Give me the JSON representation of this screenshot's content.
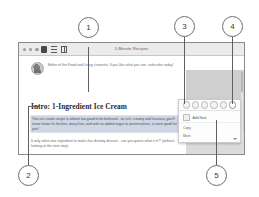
{
  "window": {
    "title": "5-Minute Recipes",
    "traffic_lights": [
      "close",
      "minimize",
      "zoom"
    ],
    "toolbar_icons": [
      "sidebar-icon",
      "list-view-icon",
      "grid-view-icon"
    ]
  },
  "article": {
    "byline": "Editor of the Food and Living channels. If you like what you see, subscribe today!",
    "heading": "Intro: 1-Ingredient Ice Cream",
    "paragraphs": [
      "This ice cream recipe is almost too good to be believed - so rich, creamy and luscious, you'll never know it's fat-free, dairy-free, and with no added sugar or preservatives, is even good for you!",
      "It only takes one ingredient to make this dreamy dessert - can you guess what it is?! (without looking at the next step)",
      "You may argue that without dairy, this has no place being called 'ice"
    ]
  },
  "context_menu": {
    "icons": [
      "highlight-yellow-icon",
      "highlight-green-icon",
      "highlight-blue-icon",
      "highlight-pink-icon",
      "underline-icon",
      "erase-highlight-icon"
    ],
    "items": [
      {
        "label": "Add Note",
        "icon": "note-icon"
      },
      {
        "label": "Copy",
        "icon": "copy-icon"
      },
      {
        "label": "More",
        "icon": "more-icon"
      }
    ]
  },
  "callouts": [
    {
      "number": "1"
    },
    {
      "number": "2"
    },
    {
      "number": "3"
    },
    {
      "number": "4"
    },
    {
      "number": "5"
    }
  ]
}
